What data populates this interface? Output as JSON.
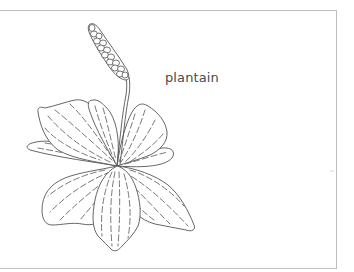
{
  "illustration": {
    "subject": "plantain plant line drawing",
    "label": "plantain",
    "colors": {
      "line": "#555555",
      "frame": "#bdbdbd",
      "background": "#ffffff",
      "label_text": "#4a4a4a"
    }
  }
}
